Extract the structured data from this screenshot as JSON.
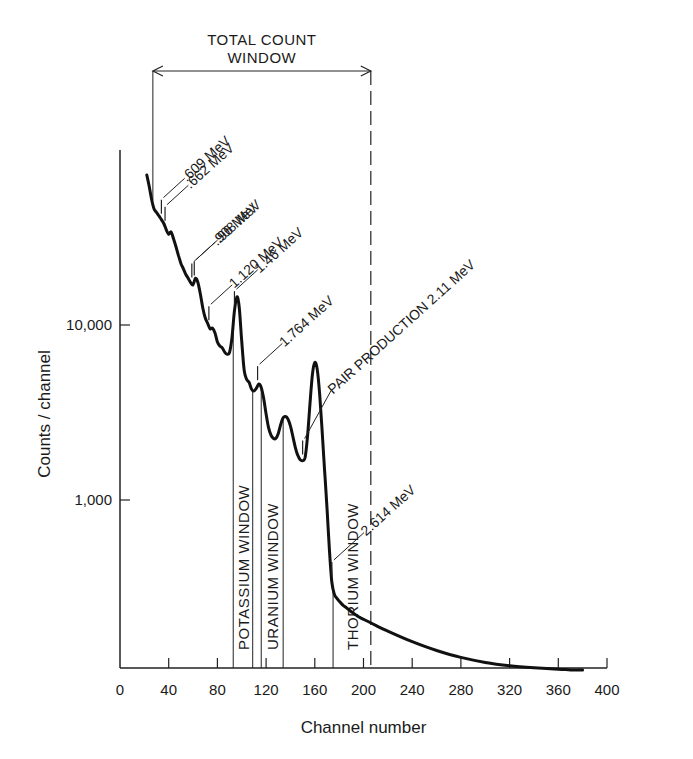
{
  "chart_data": {
    "type": "line",
    "title": "",
    "xlabel": "Channel number",
    "ylabel": "Counts / channel",
    "xlim": [
      0,
      400
    ],
    "ylim": [
      110,
      100000
    ],
    "yscale": "log",
    "grid": false,
    "x_ticks": [
      0,
      40,
      80,
      120,
      160,
      200,
      240,
      280,
      320,
      360,
      400
    ],
    "x_tick_labels": [
      "0",
      "40",
      "80",
      "120",
      "160",
      "200",
      "240",
      "280",
      "320",
      "360",
      "400"
    ],
    "y_ticks": [
      10000,
      1000
    ],
    "y_tick_labels": [
      "10,000",
      "1,000"
    ],
    "series": [
      {
        "name": "Gamma-ray spectrum",
        "x": [
          22,
          24,
          26,
          28,
          30,
          32,
          34,
          36,
          38,
          40,
          42,
          44,
          46,
          48,
          50,
          52,
          54,
          56,
          58,
          60,
          62,
          64,
          66,
          68,
          70,
          72,
          74,
          76,
          78,
          80,
          82,
          84,
          86,
          88,
          90,
          92,
          94,
          96,
          98,
          100,
          102,
          104,
          106,
          108,
          110,
          112,
          114,
          116,
          118,
          120,
          122,
          124,
          126,
          128,
          130,
          132,
          134,
          136,
          138,
          140,
          142,
          144,
          146,
          148,
          150,
          152,
          154,
          156,
          158,
          160,
          162,
          164,
          166,
          168,
          170,
          172,
          174,
          176,
          178,
          180,
          182,
          184,
          186,
          188,
          190,
          192,
          194,
          196,
          200,
          210,
          220,
          240,
          260,
          280,
          300,
          320,
          340,
          360,
          370,
          380
        ],
        "y": [
          72000,
          62000,
          52000,
          46000,
          44000,
          42000,
          40000,
          38000,
          35000,
          33000,
          34000,
          31000,
          28000,
          25000,
          22500,
          21000,
          19500,
          18500,
          17500,
          17000,
          18500,
          17500,
          15000,
          12500,
          11000,
          10200,
          9500,
          9600,
          9000,
          8000,
          7600,
          7400,
          7000,
          6800,
          7000,
          8500,
          12000,
          14500,
          12500,
          8000,
          5500,
          4900,
          4700,
          4300,
          4200,
          4350,
          4600,
          4400,
          3800,
          3100,
          2600,
          2350,
          2250,
          2250,
          2400,
          2700,
          2950,
          3000,
          2900,
          2650,
          2300,
          2000,
          1800,
          1700,
          1680,
          1750,
          2300,
          3500,
          5200,
          6100,
          5600,
          4000,
          2500,
          1500,
          900,
          520,
          340,
          290,
          275,
          265,
          255,
          248,
          242,
          236,
          230,
          225,
          220,
          215,
          208,
          192,
          178,
          155,
          138,
          126,
          118,
          113,
          110,
          108,
          107,
          107
        ]
      }
    ],
    "peak_annotations": [
      {
        "label": ".609 MeV",
        "channel": 34
      },
      {
        "label": ".662 MeV",
        "channel": 37
      },
      {
        "label": ".908 MeV",
        "channel": 59
      },
      {
        "label": ".96 MeV",
        "channel": 61
      },
      {
        "label": "1.120 MeV",
        "channel": 73
      },
      {
        "label": "1.46 MeV",
        "channel": 94
      },
      {
        "label": "1.764 MeV",
        "channel": 113
      },
      {
        "label": "PAIR PRODUCTION  2.11 MeV",
        "channel": 150
      },
      {
        "label": "2.614 MeV",
        "channel": 174
      }
    ],
    "windows": [
      {
        "label": "POTASSIUM WINDOW",
        "start": 93,
        "end": 109
      },
      {
        "label": "URANIUM WINDOW",
        "start": 116,
        "end": 134
      },
      {
        "label": "THORIUM WINDOW",
        "start": 175,
        "end": 206
      }
    ],
    "total_count_window": {
      "label_line1": "TOTAL COUNT",
      "label_line2": "WINDOW",
      "start": 27,
      "end": 206
    }
  }
}
